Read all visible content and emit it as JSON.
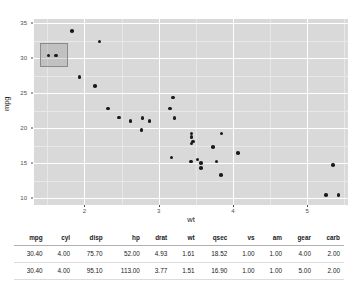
{
  "chart_data": {
    "type": "scatter",
    "title": "",
    "xlabel": "wt",
    "ylabel": "mpg",
    "xlim": [
      1.32,
      5.55
    ],
    "ylim": [
      9.0,
      35.6
    ],
    "xticks": [
      "2",
      "3",
      "4",
      "5"
    ],
    "xtick_values": [
      2,
      3,
      4,
      5
    ],
    "yticks": [
      "10",
      "15",
      "20",
      "25",
      "30",
      "35"
    ],
    "ytick_values": [
      10,
      15,
      20,
      25,
      30,
      35
    ],
    "grid": true,
    "legend": "none",
    "points": [
      {
        "wt": 2.62,
        "mpg": 21.0
      },
      {
        "wt": 2.875,
        "mpg": 21.0
      },
      {
        "wt": 2.32,
        "mpg": 22.8
      },
      {
        "wt": 3.215,
        "mpg": 21.4
      },
      {
        "wt": 3.44,
        "mpg": 18.7
      },
      {
        "wt": 3.46,
        "mpg": 18.1
      },
      {
        "wt": 3.57,
        "mpg": 14.3
      },
      {
        "wt": 3.19,
        "mpg": 24.4
      },
      {
        "wt": 3.15,
        "mpg": 22.8
      },
      {
        "wt": 3.44,
        "mpg": 19.2
      },
      {
        "wt": 3.44,
        "mpg": 17.8
      },
      {
        "wt": 4.07,
        "mpg": 16.4
      },
      {
        "wt": 3.73,
        "mpg": 17.3
      },
      {
        "wt": 3.78,
        "mpg": 15.2
      },
      {
        "wt": 5.25,
        "mpg": 10.4
      },
      {
        "wt": 5.424,
        "mpg": 10.4
      },
      {
        "wt": 5.345,
        "mpg": 14.7
      },
      {
        "wt": 2.2,
        "mpg": 32.4
      },
      {
        "wt": 1.615,
        "mpg": 30.4
      },
      {
        "wt": 1.835,
        "mpg": 33.9
      },
      {
        "wt": 2.465,
        "mpg": 21.5
      },
      {
        "wt": 3.52,
        "mpg": 15.5
      },
      {
        "wt": 3.435,
        "mpg": 15.2
      },
      {
        "wt": 3.84,
        "mpg": 13.3
      },
      {
        "wt": 3.845,
        "mpg": 19.2
      },
      {
        "wt": 1.935,
        "mpg": 27.3
      },
      {
        "wt": 2.14,
        "mpg": 26.0
      },
      {
        "wt": 1.513,
        "mpg": 30.4
      },
      {
        "wt": 3.17,
        "mpg": 15.8
      },
      {
        "wt": 2.77,
        "mpg": 19.7
      },
      {
        "wt": 3.57,
        "mpg": 15.0
      },
      {
        "wt": 2.78,
        "mpg": 21.4
      }
    ],
    "selection": {
      "label": "brush-selection",
      "x_range": [
        1.4,
        1.78
      ],
      "y_range": [
        28.7,
        32.2
      ],
      "selected_count": 2
    }
  },
  "table": {
    "columns": [
      "mpg",
      "cyl",
      "disp",
      "hp",
      "drat",
      "wt",
      "qsec",
      "vs",
      "am",
      "gear",
      "carb"
    ],
    "rows": [
      [
        "30.40",
        "4.00",
        "75.70",
        "52.00",
        "4.93",
        "1.61",
        "18.52",
        "1.00",
        "1.00",
        "4.00",
        "2.00"
      ],
      [
        "30.40",
        "4.00",
        "95.10",
        "113.00",
        "3.77",
        "1.51",
        "16.90",
        "1.00",
        "1.00",
        "5.00",
        "2.00"
      ]
    ]
  },
  "colors": {
    "panel_bg": "#d9d9d9",
    "grid_major": "#ffffff",
    "grid_minor": "#e8e8e8",
    "point": "#1a1a1a",
    "brush_fill": "rgba(140,140,140,0.30)",
    "brush_border": "#8a8a8a",
    "page_bg": "#ffffff"
  }
}
